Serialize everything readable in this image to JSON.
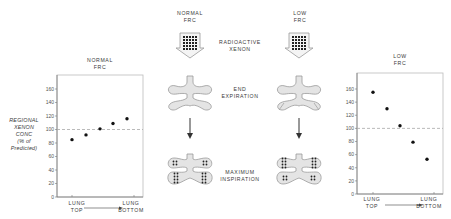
{
  "columns": {
    "normal": {
      "title": "NORMAL\nFRC"
    },
    "low": {
      "title": "LOW\nFRC"
    }
  },
  "steps": {
    "xenon": "RADIOACTIVE\nXENON",
    "end_exp": "END\nEXPIRATION",
    "max_insp": "MAXIMUM\nINSPIRATION"
  },
  "y_axis_label": "REGIONAL\nXENON\nCONC\n(% of\nPredicted)",
  "chart_data": [
    {
      "type": "scatter",
      "title": "NORMAL FRC",
      "xlabel": "LUNG TOP → LUNG BOTTOM",
      "ylabel": "REGIONAL XENON CONC (% of Predicted)",
      "x_tick_labels": [
        "LUNG\nTOP",
        "LUNG\nBOTTOM"
      ],
      "y_ticks": [
        0,
        20,
        40,
        60,
        80,
        100,
        120,
        140,
        160
      ],
      "ylim": [
        0,
        170
      ],
      "reference_line": 100,
      "x": [
        1,
        2,
        3,
        4,
        5
      ],
      "values": [
        85,
        92,
        101,
        109,
        116
      ]
    },
    {
      "type": "scatter",
      "title": "LOW FRC",
      "xlabel": "LUNG TOP → LUNG BOTTOM",
      "ylabel": "",
      "x_tick_labels": [
        "LUNG\nTOP",
        "LUNG\nBOTTOM"
      ],
      "y_ticks": [
        0,
        20,
        40,
        60,
        80,
        100,
        120,
        140,
        160
      ],
      "ylim": [
        0,
        170
      ],
      "reference_line": 100,
      "x": [
        1,
        2,
        3,
        4,
        5
      ],
      "values": [
        155,
        130,
        104,
        79,
        53
      ]
    }
  ],
  "colors": {
    "ink": "#222222",
    "lung_fill": "#e4e4e4",
    "lung_stroke": "#9a9a9a",
    "ref_line": "#a8a8a8"
  }
}
